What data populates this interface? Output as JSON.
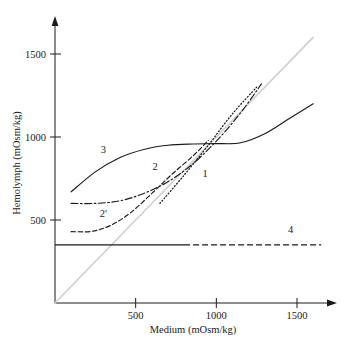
{
  "chart_data": {
    "type": "line",
    "title": "",
    "xlabel": "Medium (mOsm/kg)",
    "ylabel": "Hemolymph (mOsm/kg)",
    "xlim": [
      0,
      1700
    ],
    "ylim": [
      0,
      1700
    ],
    "xticks": [
      500,
      1000,
      1500
    ],
    "xtick_labels": [
      "500",
      "1000",
      "1500"
    ],
    "yticks": [
      500,
      1000,
      1500
    ],
    "ytick_labels": [
      "500",
      "1000",
      "1500"
    ],
    "grid": false,
    "legend_position": "inline-curve-labels",
    "series": [
      {
        "name": "isosmotic",
        "label": "",
        "style": "solid",
        "color": "#cfcfcf",
        "comment": "isosmotic reference diagonal",
        "points": [
          [
            0,
            0
          ],
          [
            1600,
            1600
          ]
        ]
      },
      {
        "name": "1",
        "label": "1",
        "style": "dotted",
        "color": "#1a1a1a",
        "points": [
          [
            650,
            600
          ],
          [
            800,
            770
          ],
          [
            950,
            950
          ],
          [
            1100,
            1140
          ],
          [
            1250,
            1300
          ]
        ]
      },
      {
        "name": "2",
        "label": "2",
        "style": "dash-dot",
        "color": "#1a1a1a",
        "points": [
          [
            100,
            600
          ],
          [
            250,
            600
          ],
          [
            400,
            615
          ],
          [
            550,
            660
          ],
          [
            700,
            730
          ],
          [
            850,
            835
          ],
          [
            1000,
            975
          ],
          [
            1150,
            1145
          ],
          [
            1280,
            1320
          ]
        ]
      },
      {
        "name": "2prime",
        "label": "2'",
        "style": "dashed",
        "color": "#1a1a1a",
        "points": [
          [
            100,
            430
          ],
          [
            230,
            432
          ],
          [
            350,
            470
          ],
          [
            470,
            545
          ],
          [
            600,
            660
          ],
          [
            730,
            780
          ],
          [
            860,
            890
          ],
          [
            950,
            980
          ]
        ]
      },
      {
        "name": "3",
        "label": "3",
        "style": "solid",
        "color": "#1a1a1a",
        "points": [
          [
            100,
            670
          ],
          [
            250,
            790
          ],
          [
            400,
            875
          ],
          [
            550,
            925
          ],
          [
            700,
            950
          ],
          [
            850,
            958
          ],
          [
            1000,
            960
          ],
          [
            1150,
            965
          ],
          [
            1300,
            1020
          ],
          [
            1450,
            1110
          ],
          [
            1600,
            1200
          ]
        ]
      },
      {
        "name": "4",
        "label": "4",
        "style": "solid-then-dashed",
        "color": "#1a1a1a",
        "points": [
          [
            0,
            350
          ],
          [
            1650,
            350
          ]
        ],
        "solid_until": 800
      }
    ],
    "curve_labels": [
      {
        "text": "3",
        "x": 300,
        "y": 905
      },
      {
        "text": "2",
        "x": 620,
        "y": 800
      },
      {
        "text": "2'",
        "x": 300,
        "y": 520
      },
      {
        "text": "1",
        "x": 930,
        "y": 760
      },
      {
        "text": "4",
        "x": 1460,
        "y": 420
      }
    ]
  },
  "axes": {
    "x_title": "Medium (mOsm/kg)",
    "y_title": "Hemolymph (mOsm/kg)",
    "x_tick_labels": [
      "500",
      "1000",
      "1500"
    ],
    "y_tick_labels": [
      "500",
      "1000",
      "1500"
    ],
    "x_arrow": true,
    "y_arrow": true
  },
  "colors": {
    "ink": "#1a1a1a",
    "isosmotic": "#cfcfcf",
    "background": "#ffffff"
  }
}
